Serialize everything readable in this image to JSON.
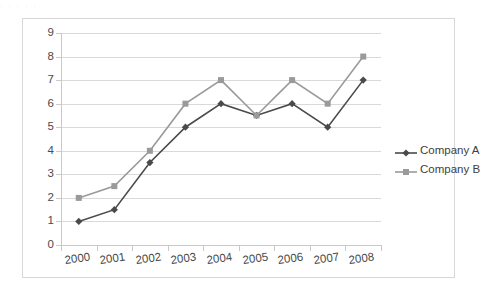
{
  "chart_data": {
    "type": "line",
    "title": "",
    "subtitle": "",
    "xlabel": "",
    "ylabel": "",
    "categories": [
      "2000",
      "2001",
      "2002",
      "2003",
      "2004",
      "2005",
      "2006",
      "2007",
      "2008"
    ],
    "series": [
      {
        "name": "Company A",
        "color": "#4a4a4a",
        "marker": "diamond",
        "values": [
          1,
          1.5,
          3.5,
          5,
          6,
          5.5,
          6,
          5,
          7
        ]
      },
      {
        "name": "Company B",
        "color": "#9a9a9a",
        "marker": "square",
        "values": [
          2,
          2.5,
          4,
          6,
          7,
          5.5,
          7,
          6,
          8
        ]
      }
    ],
    "ylim": [
      0,
      9
    ],
    "y_ticks": [
      0,
      1,
      2,
      3,
      4,
      5,
      6,
      7,
      8,
      9
    ],
    "y_tick_labels": [
      "0",
      "1",
      "2",
      "3",
      "4",
      "5",
      "6",
      "7",
      "8",
      "9"
    ],
    "grid": true,
    "grid_axis": "y",
    "legend_position": "right",
    "legend_entries": [
      "Company A",
      "Company B"
    ]
  },
  "top_bleed_text": ". .    .  .  .",
  "colors": {
    "series_a": "#4a4a4a",
    "series_b": "#9a9a9a",
    "gridline": "#d9d9d9",
    "axis": "#c9c9c9",
    "frame_border": "#d8d8d8",
    "text": "#4a4a4a",
    "background": "#ffffff"
  }
}
